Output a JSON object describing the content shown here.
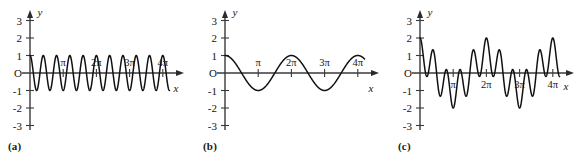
{
  "figure": {
    "background_color": "#ffffff",
    "curve_color": "#111111",
    "axis_color": "#3a3a3a",
    "panels": [
      {
        "caption": "(a)",
        "y_axis_label": "y",
        "x_axis_label": "x",
        "origin_label": "O",
        "y_ticks": [
          "3",
          "2",
          "1",
          "-1",
          "-2",
          "-3"
        ],
        "x_ticks": [
          "π",
          "2π",
          "3π",
          "4π"
        ]
      },
      {
        "caption": "(b)",
        "y_axis_label": "y",
        "x_axis_label": "x",
        "origin_label": "O",
        "y_ticks": [
          "3",
          "2",
          "1",
          "-1",
          "-2",
          "-3"
        ],
        "x_ticks": [
          "π",
          "2π",
          "3π",
          "4π"
        ]
      },
      {
        "caption": "(c)",
        "y_axis_label": "y",
        "x_axis_label": "x",
        "origin_label": "O",
        "y_ticks": [
          "3",
          "2",
          "1",
          "-1",
          "-2",
          "-3"
        ],
        "x_ticks": [
          "π",
          "2π",
          "3π",
          "4π"
        ]
      }
    ]
  },
  "chart_data": [
    {
      "type": "line",
      "panel": "(a)",
      "title": "",
      "xlabel": "x",
      "ylabel": "y",
      "expression": "cos(5x)",
      "amplitude": 1,
      "frequency": 5,
      "xlim": [
        0,
        13.2
      ],
      "ylim": [
        -3,
        3
      ],
      "xtick_values": [
        3.14159,
        6.28319,
        9.42478,
        12.56637
      ],
      "xtick_labels": [
        "π",
        "2π",
        "3π",
        "4π"
      ],
      "ytick_values": [
        3,
        2,
        1,
        0,
        -1,
        -2,
        -3
      ],
      "ytick_labels": [
        "3",
        "2",
        "1",
        "O",
        "-1",
        "-2",
        "-3"
      ],
      "grid": false,
      "legend": "none",
      "y_at_zero": 1,
      "num_full_cycles_to_4pi": 10,
      "peak_value": 1,
      "trough_value": -1
    },
    {
      "type": "line",
      "panel": "(b)",
      "title": "",
      "xlabel": "x",
      "ylabel": "y",
      "expression": "cos(x)",
      "amplitude": 1,
      "frequency": 1,
      "xlim": [
        0,
        13.2
      ],
      "ylim": [
        -3,
        3
      ],
      "xtick_values": [
        3.14159,
        6.28319,
        9.42478,
        12.56637
      ],
      "xtick_labels": [
        "π",
        "2π",
        "3π",
        "4π"
      ],
      "ytick_values": [
        3,
        2,
        1,
        0,
        -1,
        -2,
        -3
      ],
      "ytick_labels": [
        "3",
        "2",
        "1",
        "O",
        "-1",
        "-2",
        "-3"
      ],
      "grid": false,
      "legend": "none",
      "y_at_zero": 1,
      "num_full_cycles_to_4pi": 2,
      "peak_value": 1,
      "trough_value": -1
    },
    {
      "type": "line",
      "panel": "(c)",
      "title": "",
      "xlabel": "x",
      "ylabel": "y",
      "expression": "cos(x) + cos(5x)",
      "amplitude": 2,
      "xlim": [
        0,
        13.2
      ],
      "ylim": [
        -3,
        3
      ],
      "xtick_values": [
        3.14159,
        6.28319,
        9.42478,
        12.56637
      ],
      "xtick_labels": [
        "π",
        "2π",
        "3π",
        "4π"
      ],
      "ytick_values": [
        3,
        2,
        1,
        0,
        -1,
        -2,
        -3
      ],
      "ytick_labels": [
        "3",
        "2",
        "1",
        "O",
        "-1",
        "-2",
        "-3"
      ],
      "grid": false,
      "legend": "none",
      "y_at_zero": 2,
      "peak_value": 1.8,
      "trough_value": -1.8
    }
  ]
}
